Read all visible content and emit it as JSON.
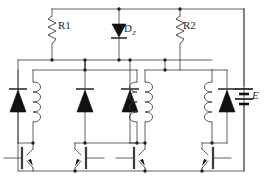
{
  "diagram": {
    "type": "electronic-schematic",
    "stroke_color": "#3a3a3a",
    "fill_color": "#111111",
    "background": "#ffffff"
  },
  "labels": {
    "r1": "R1",
    "dz_letter": "D",
    "dz_subscript": "Z",
    "r2": "R2",
    "battery": "E"
  },
  "components": [
    {
      "name": "resistor-r1",
      "label": "R1",
      "type": "resistor"
    },
    {
      "name": "zener-diode-dz",
      "label": "DZ",
      "type": "zener-diode"
    },
    {
      "name": "resistor-r2",
      "label": "R2",
      "type": "resistor"
    },
    {
      "name": "battery-e",
      "label": "E",
      "type": "battery"
    },
    {
      "name": "coil-1",
      "label": "",
      "type": "inductor"
    },
    {
      "name": "coil-2",
      "label": "",
      "type": "inductor"
    },
    {
      "name": "coil-3",
      "label": "",
      "type": "inductor"
    },
    {
      "name": "coil-4",
      "label": "",
      "type": "inductor"
    },
    {
      "name": "flyback-diode-1",
      "label": "",
      "type": "diode"
    },
    {
      "name": "flyback-diode-2",
      "label": "",
      "type": "diode"
    },
    {
      "name": "flyback-diode-3",
      "label": "",
      "type": "diode"
    },
    {
      "name": "flyback-diode-4",
      "label": "",
      "type": "diode"
    },
    {
      "name": "transistor-q1",
      "label": "",
      "type": "npn-transistor"
    },
    {
      "name": "transistor-q2",
      "label": "",
      "type": "npn-transistor"
    },
    {
      "name": "transistor-q3",
      "label": "",
      "type": "npn-transistor"
    },
    {
      "name": "transistor-q4",
      "label": "",
      "type": "npn-transistor"
    }
  ]
}
